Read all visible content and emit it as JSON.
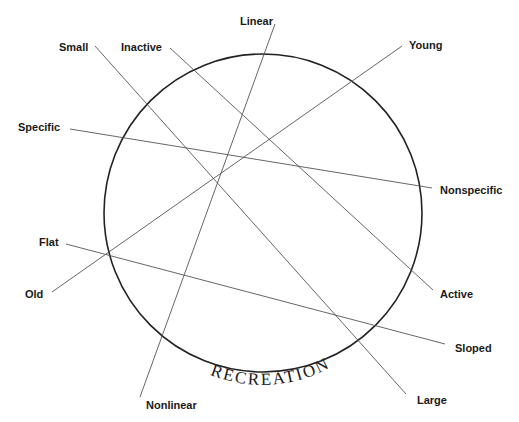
{
  "diagram": {
    "circle_label": "RECREATION",
    "circle": {
      "cx": 263,
      "cy": 213,
      "r": 159
    },
    "axes": [
      {
        "id": "linear-nonlinear",
        "start": {
          "label": "Linear",
          "x": 275,
          "y": 24
        },
        "end": {
          "label": "Nonlinear",
          "x": 140,
          "y": 397
        }
      },
      {
        "id": "small-large",
        "start": {
          "label": "Small",
          "x": 95,
          "y": 46
        },
        "end": {
          "label": "Large",
          "x": 406,
          "y": 394
        }
      },
      {
        "id": "inactive-active",
        "start": {
          "label": "Inactive",
          "x": 170,
          "y": 48
        },
        "end": {
          "label": "Active",
          "x": 433,
          "y": 290
        }
      },
      {
        "id": "young-old",
        "start": {
          "label": "Young",
          "x": 402,
          "y": 46
        },
        "end": {
          "label": "Old",
          "x": 52,
          "y": 292
        }
      },
      {
        "id": "specific-nonspecific",
        "start": {
          "label": "Specific",
          "x": 70,
          "y": 129
        },
        "end": {
          "label": "Nonspecific",
          "x": 432,
          "y": 188
        }
      },
      {
        "id": "flat-sloped",
        "start": {
          "label": "Flat",
          "x": 66,
          "y": 244
        },
        "end": {
          "label": "Sloped",
          "x": 445,
          "y": 344
        }
      }
    ]
  }
}
